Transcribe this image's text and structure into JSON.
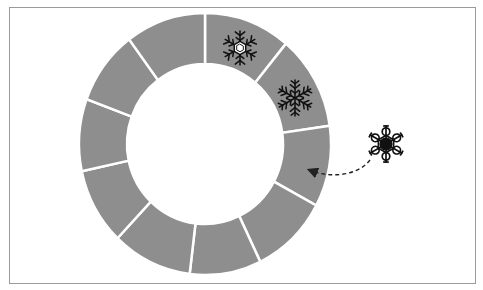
{
  "diagram": {
    "type": "segmented-ring",
    "segment_count": 10,
    "segment_color": "#8e8e8e",
    "divider_color": "#ffffff",
    "frame_color": "#9a9a9a",
    "center": [
      205,
      144
    ],
    "outer_radius": [
      126,
      131
    ],
    "inner_radius": [
      78,
      80
    ],
    "divider_angles_deg": [
      -90,
      -50,
      -8,
      28,
      64,
      97,
      134,
      168,
      200,
      233
    ],
    "placed_items": [
      {
        "name": "snowflake-hexagon-center",
        "segment": 1,
        "x": 240,
        "y": 48,
        "size": 20
      },
      {
        "name": "snowflake-fern",
        "segment": 2,
        "x": 295,
        "y": 98,
        "size": 20
      }
    ],
    "incoming_item": {
      "name": "snowflake-lace",
      "x": 386,
      "y": 145,
      "size": 20
    },
    "arrow": {
      "style": "dashed",
      "from": [
        368,
        162
      ],
      "to": [
        310,
        172
      ],
      "color": "#333333"
    }
  }
}
